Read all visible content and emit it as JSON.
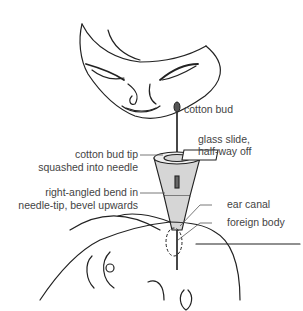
{
  "diagram": {
    "labels": {
      "cotton_bud": "cotton bud",
      "glass_slide_line1": "glass slide,",
      "glass_slide_line2": "half-way off",
      "cotton_tip_line1": "cotton bud tip",
      "cotton_tip_line2": "squashed into needle",
      "bend_line1": "right-angled bend in",
      "bend_line2": "needle-tip, bevel upwards",
      "ear_canal": "ear canal",
      "foreign_body": "foreign body"
    },
    "colors": {
      "line": "#222222",
      "funnel_fill": "#d6d6d6",
      "text": "#444444"
    }
  }
}
